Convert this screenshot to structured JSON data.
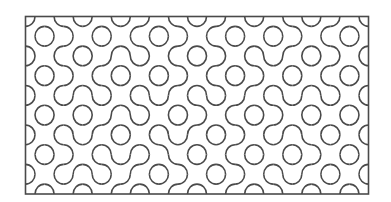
{
  "figure": {
    "type": "truchet-tiling",
    "grid": {
      "cols": 18,
      "rows": 9
    },
    "colors": {
      "stroke": "#4a4a4a",
      "background": "#ffffff"
    },
    "tiles": [
      "ABBABAABBAABABBAAB",
      "BAABABBAABBABAABBA",
      "ABBAABABBAABBABAAB",
      "BAABBABAABBAABABBA",
      "ABABABBABBAABBABAB",
      "BABAABABAABBAABABA",
      "ABBABABBABAABABBAB",
      "BAABBAABBABBABAABA",
      "ABABAABAABAABBABAB"
    ]
  }
}
